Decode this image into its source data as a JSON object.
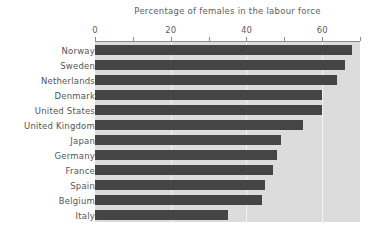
{
  "chart_data": {
    "type": "bar",
    "orientation": "horizontal",
    "title": "Percentage of females in the labour force",
    "xlabel": "",
    "ylabel": "",
    "xlim": [
      0,
      70
    ],
    "grid": true,
    "legend": null,
    "tick_values": [
      0,
      10,
      20,
      30,
      40,
      50,
      60,
      70
    ],
    "tick_labels": [
      "0",
      "",
      "20",
      "",
      "40",
      "",
      "60",
      ""
    ],
    "gridline_values": [
      20,
      40,
      60
    ],
    "bar_color": "#454545",
    "plot_background": "#dcdcdc",
    "categories": [
      "Norway",
      "Sweden",
      "Netherlands",
      "Denmark",
      "United States",
      "United Kingdom",
      "Japan",
      "Germany",
      "France",
      "Spain",
      "Belgium",
      "Italy"
    ],
    "values": [
      68,
      66,
      64,
      60,
      60,
      55,
      49,
      48,
      47,
      45,
      44,
      35
    ]
  }
}
